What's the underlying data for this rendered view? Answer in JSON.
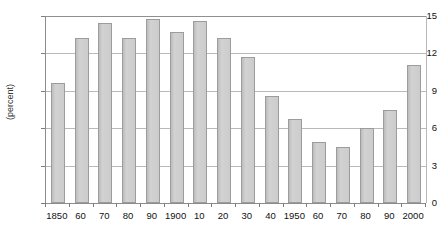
{
  "chart_data": {
    "type": "bar",
    "title": "",
    "xlabel": "",
    "ylabel": "(percent)",
    "ylim": [
      0,
      15
    ],
    "yticks": [
      0,
      3,
      6,
      9,
      12,
      15
    ],
    "ytick_labels": [
      "0",
      "3",
      "6",
      "9",
      "12",
      "15"
    ],
    "grid": true,
    "legend": "none",
    "categories": [
      "1850",
      "60",
      "70",
      "80",
      "90",
      "1900",
      "10",
      "20",
      "30",
      "40",
      "1950",
      "60",
      "70",
      "80",
      "90",
      "2000"
    ],
    "values": [
      9.6,
      13.2,
      14.4,
      13.2,
      14.8,
      13.7,
      14.6,
      13.2,
      11.7,
      8.6,
      6.7,
      4.9,
      4.5,
      6.0,
      7.5,
      11.1
    ],
    "bar_color": "#c9c9c9",
    "bar_border_color": "#9c9c9c",
    "gridline_color": "#b9b9b9",
    "axis_color": "#8c8c8c"
  }
}
